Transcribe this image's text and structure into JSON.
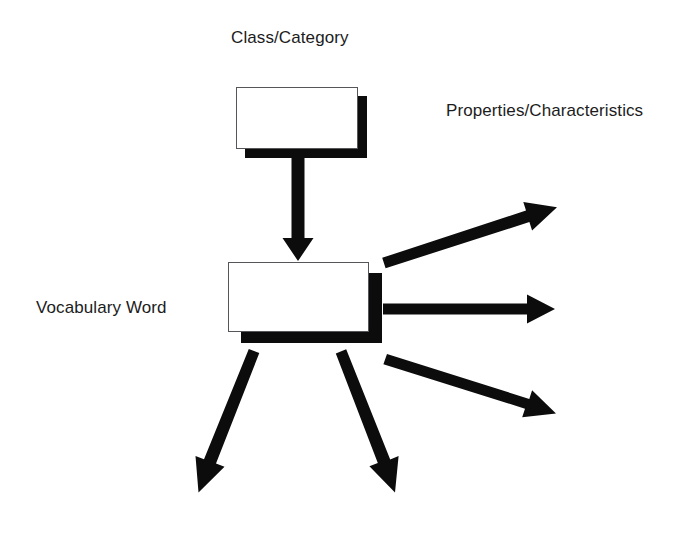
{
  "diagram": {
    "type": "concept-map",
    "title_text_present": false,
    "background_color": "#ffffff",
    "ink_color": "#0c0c0c",
    "text_color": "#1c1c1c",
    "box_border_color": "#55555a",
    "box_fill_color": "#ffffff",
    "labels": {
      "class_category": "Class/Category",
      "properties_characteristics": "Properties/Characteristics",
      "vocabulary_word": "Vocabulary Word"
    },
    "boxes": [
      {
        "name": "class-category-box",
        "label_ref": "class_category",
        "x": 236,
        "y": 87,
        "width": 122,
        "height": 62,
        "shadow_offset_x": 9,
        "shadow_offset_y": 9,
        "content": ""
      },
      {
        "name": "vocabulary-word-box",
        "label_ref": "vocabulary_word",
        "x": 228,
        "y": 262,
        "width": 141,
        "height": 70,
        "shadow_offset_x": 13,
        "shadow_offset_y": 11,
        "content": ""
      }
    ],
    "arrows": [
      {
        "name": "arrow-class-to-word",
        "direction": "down",
        "x1": 298,
        "y1": 158,
        "x2": 298,
        "y2": 260,
        "shaft_width": 13,
        "head_width": 31,
        "head_length": 23
      },
      {
        "name": "arrow-word-to-property-1",
        "direction": "up-right",
        "x1": 384,
        "y1": 263,
        "x2": 557,
        "y2": 207,
        "shaft_width": 11,
        "head_width": 30,
        "head_length": 29
      },
      {
        "name": "arrow-word-to-property-2",
        "direction": "right",
        "x1": 384,
        "y1": 309,
        "x2": 555,
        "y2": 309,
        "shaft_width": 11,
        "head_width": 30,
        "head_length": 29
      },
      {
        "name": "arrow-word-to-property-3",
        "direction": "down-right",
        "x1": 385,
        "y1": 359,
        "x2": 556,
        "y2": 413,
        "shaft_width": 11,
        "head_width": 30,
        "head_length": 29
      },
      {
        "name": "arrow-word-to-property-4",
        "direction": "down-left",
        "x1": 254,
        "y1": 351,
        "x2": 199,
        "y2": 492,
        "shaft_width": 11,
        "head_width": 30,
        "head_length": 29
      },
      {
        "name": "arrow-word-to-property-5",
        "direction": "down-right",
        "x1": 341,
        "y1": 351,
        "x2": 394,
        "y2": 492,
        "shaft_width": 11,
        "head_width": 30,
        "head_length": 29
      }
    ]
  }
}
